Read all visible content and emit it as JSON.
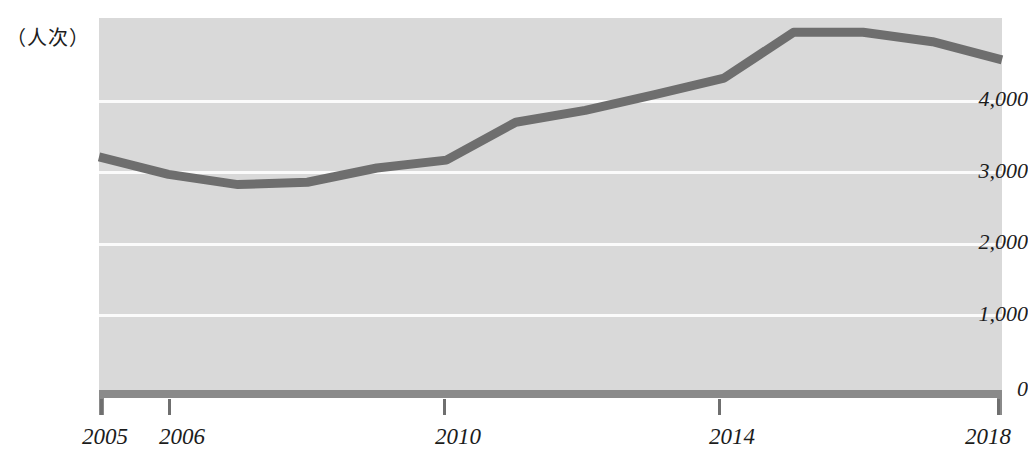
{
  "chart_data": {
    "type": "line",
    "title": "",
    "subtitle": "",
    "xlabel": "",
    "ylabel": "（人次）",
    "unit_caption": "（人次）",
    "grid": true,
    "legend": "none",
    "line_color": "#6e6e6e",
    "plot_background": "#d9d9d9",
    "gridline_color": "#fbfbfb",
    "axis_color": "#8a8a8a",
    "text_color": "#1c1c1c",
    "xlim": [
      2005,
      2018
    ],
    "ylim": [
      0,
      4800
    ],
    "y_ticks": [
      0,
      1000,
      2000,
      3000,
      4000
    ],
    "y_tick_labels": [
      "0",
      "1,000",
      "2,000",
      "3,000",
      "4,000"
    ],
    "x_ticks": [
      2005,
      2006,
      2010,
      2014,
      2018
    ],
    "x_tick_labels": [
      "2005",
      "2006",
      "2010",
      "2014",
      "2018"
    ],
    "x": [
      2005,
      2006,
      2007,
      2008,
      2009,
      2010,
      2011,
      2012,
      2013,
      2014,
      2015,
      2016,
      2017,
      2018
    ],
    "values": [
      3040,
      2820,
      2690,
      2720,
      2900,
      3000,
      3480,
      3630,
      3830,
      4040,
      4620,
      4620,
      4500,
      4270
    ],
    "series": [
      {
        "name": "人次",
        "values": [
          3040,
          2820,
          2690,
          2720,
          2900,
          3000,
          3480,
          3630,
          3830,
          4040,
          4620,
          4620,
          4500,
          4270
        ]
      }
    ]
  },
  "axis": {
    "y_unit_caption": "（人次）",
    "y_labels": [
      "4,000",
      "3,000",
      "2,000",
      "1,000",
      "0"
    ],
    "x_labels": [
      "2005",
      "2006",
      "2010",
      "2014",
      "2018"
    ]
  }
}
